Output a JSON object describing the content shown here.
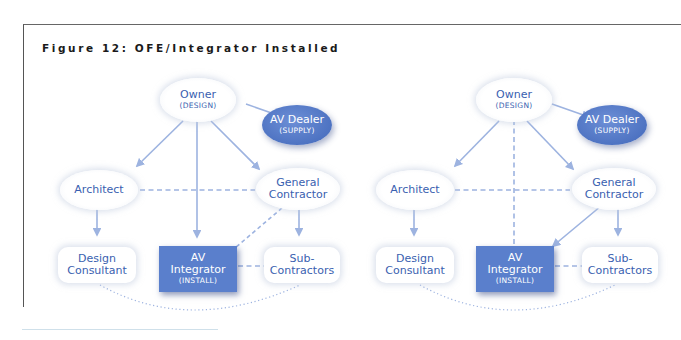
{
  "figure": {
    "title": "Figure 12: OFE/Integrator Installed"
  },
  "colors": {
    "node_text": "#3a5fb0",
    "connector": "#9db3e0",
    "dark_node_fill": "#5a7fcc",
    "dealer_fill": "#4e73c2"
  },
  "diagrams": [
    {
      "nodes": {
        "owner": {
          "label": "Owner",
          "sub": "(DESIGN)"
        },
        "av_dealer": {
          "label": "AV Dealer",
          "sub": "(SUPPLY)"
        },
        "architect": {
          "label": "Architect"
        },
        "general_contractor": {
          "label_line1": "General",
          "label_line2": "Contractor"
        },
        "design_consultant": {
          "label_line1": "Design",
          "label_line2": "Consultant"
        },
        "av_integrator": {
          "label_line1": "AV",
          "label_line2": "Integrator",
          "sub": "(INSTALL)"
        },
        "sub_contractors": {
          "label_line1": "Sub-",
          "label_line2": "Contractors"
        }
      },
      "edges": [
        {
          "from": "owner",
          "to": "av_dealer",
          "style": "solid-arrow"
        },
        {
          "from": "owner",
          "to": "architect",
          "style": "solid-arrow"
        },
        {
          "from": "owner",
          "to": "general_contractor",
          "style": "solid-arrow"
        },
        {
          "from": "owner",
          "to": "av_integrator",
          "style": "solid-arrow"
        },
        {
          "from": "architect",
          "to": "general_contractor",
          "style": "dashed"
        },
        {
          "from": "architect",
          "to": "design_consultant",
          "style": "solid-arrow"
        },
        {
          "from": "general_contractor",
          "to": "sub_contractors",
          "style": "solid-arrow"
        },
        {
          "from": "general_contractor",
          "to": "av_integrator",
          "style": "dashed"
        },
        {
          "from": "av_integrator",
          "to": "sub_contractors",
          "style": "dashed"
        },
        {
          "from": "design_consultant",
          "to": "sub_contractors",
          "style": "dotted-arc"
        }
      ]
    },
    {
      "nodes": {
        "owner": {
          "label": "Owner",
          "sub": "(DESIGN)"
        },
        "av_dealer": {
          "label": "AV Dealer",
          "sub": "(SUPPLY)"
        },
        "architect": {
          "label": "Architect"
        },
        "general_contractor": {
          "label_line1": "General",
          "label_line2": "Contractor"
        },
        "design_consultant": {
          "label_line1": "Design",
          "label_line2": "Consultant"
        },
        "av_integrator": {
          "label_line1": "AV",
          "label_line2": "Integrator",
          "sub": "(INSTALL)"
        },
        "sub_contractors": {
          "label_line1": "Sub-",
          "label_line2": "Contractors"
        }
      },
      "edges": [
        {
          "from": "owner",
          "to": "av_dealer",
          "style": "solid-arrow"
        },
        {
          "from": "owner",
          "to": "architect",
          "style": "solid-arrow"
        },
        {
          "from": "owner",
          "to": "general_contractor",
          "style": "solid-arrow"
        },
        {
          "from": "owner",
          "to": "av_integrator",
          "style": "dashed"
        },
        {
          "from": "architect",
          "to": "general_contractor",
          "style": "dashed"
        },
        {
          "from": "architect",
          "to": "design_consultant",
          "style": "solid-arrow"
        },
        {
          "from": "general_contractor",
          "to": "sub_contractors",
          "style": "solid-arrow"
        },
        {
          "from": "general_contractor",
          "to": "av_integrator",
          "style": "solid-arrow"
        },
        {
          "from": "av_integrator",
          "to": "sub_contractors",
          "style": "dashed"
        },
        {
          "from": "design_consultant",
          "to": "sub_contractors",
          "style": "dotted-arc"
        }
      ]
    }
  ]
}
